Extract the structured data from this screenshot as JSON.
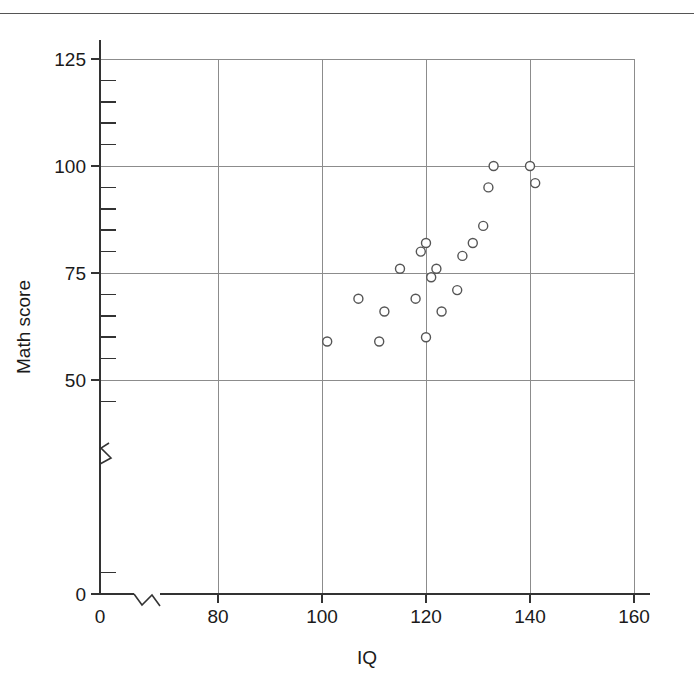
{
  "chart_data": {
    "type": "scatter",
    "title": "",
    "xlabel": "IQ",
    "ylabel": "Math score",
    "xlim": [
      0,
      165
    ],
    "ylim": [
      0,
      131
    ],
    "grid": true,
    "legend": null,
    "x_ticks_major": [
      0,
      80,
      100,
      120,
      140,
      160
    ],
    "x_tick_labels": [
      "0",
      "80",
      "100",
      "120",
      "140",
      "160"
    ],
    "y_ticks_major": [
      0,
      50,
      75,
      100,
      125
    ],
    "y_tick_labels": [
      "0",
      "50",
      "75",
      "100",
      "125"
    ],
    "y_ticks_minor": [
      5,
      45,
      55,
      60,
      65,
      70,
      80,
      85,
      90,
      95,
      105,
      110,
      115,
      120
    ],
    "x_axis_break": true,
    "y_axis_break": true,
    "x_axis_break_at": 40,
    "y_axis_break_at": 32,
    "marker": "open-circle",
    "marker_size": 9,
    "marker_color": "#ffffff",
    "marker_edge_color": "#555555",
    "grid_color": "#8c8c8c",
    "axis_color": "#333333",
    "n_points": 20,
    "x": [
      101,
      107,
      111,
      112,
      115,
      118,
      119,
      120,
      120,
      121,
      122,
      123,
      126,
      127,
      129,
      131,
      132,
      133,
      140,
      141
    ],
    "y": [
      59,
      69,
      59,
      66,
      76,
      69,
      80,
      60,
      82,
      74,
      76,
      66,
      71,
      79,
      82,
      86,
      95,
      100,
      100,
      96
    ],
    "points": [
      {
        "x": 101,
        "y": 59
      },
      {
        "x": 107,
        "y": 69
      },
      {
        "x": 111,
        "y": 59
      },
      {
        "x": 112,
        "y": 66
      },
      {
        "x": 115,
        "y": 76
      },
      {
        "x": 118,
        "y": 69
      },
      {
        "x": 119,
        "y": 80
      },
      {
        "x": 120,
        "y": 60
      },
      {
        "x": 120,
        "y": 82
      },
      {
        "x": 121,
        "y": 74
      },
      {
        "x": 122,
        "y": 76
      },
      {
        "x": 123,
        "y": 66
      },
      {
        "x": 126,
        "y": 71
      },
      {
        "x": 127,
        "y": 79
      },
      {
        "x": 129,
        "y": 82
      },
      {
        "x": 131,
        "y": 86
      },
      {
        "x": 132,
        "y": 95
      },
      {
        "x": 133,
        "y": 100
      },
      {
        "x": 140,
        "y": 100
      },
      {
        "x": 141,
        "y": 96
      }
    ]
  },
  "axes": {
    "x_title": "IQ",
    "y_title": "Math score"
  }
}
